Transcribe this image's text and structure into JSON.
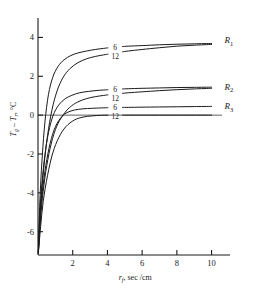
{
  "chart_data": {
    "type": "line",
    "title": "",
    "subtitle": "",
    "xlabel": "r_f , sec/cm",
    "xlabel_parts": {
      "main": "r",
      "sub": "f",
      "rest": ", sec /cm"
    },
    "ylabel": "T_g - T_r , °C",
    "ylabel_parts": {
      "t1": "T",
      "s1": "g",
      "dash": "–",
      "t2": "T",
      "s2": "r",
      "rest": ", °C"
    },
    "xlim": [
      0,
      10.6
    ],
    "ylim": [
      -7.2,
      5.0
    ],
    "xticks": [
      2,
      4,
      6,
      8,
      10
    ],
    "xtick_labels": [
      "2",
      "4",
      "6",
      "8",
      "10"
    ],
    "yticks": [
      4,
      2,
      0,
      -2,
      -4,
      -6
    ],
    "ytick_labels": [
      "4",
      "2",
      "0",
      "-2",
      "-4",
      "-6"
    ],
    "grid": false,
    "legend_position": "inline-curve-labels",
    "zero_line": true,
    "axis_color": "#1a1a1a",
    "curve_color": "#1a1a1a",
    "groups": [
      {
        "name": "R1",
        "label": "R",
        "label_sub": "1",
        "label_x": 10.75,
        "label_y": 3.85,
        "series": [
          {
            "name": "6",
            "inline_label": "6",
            "inline_label_x": 4.45,
            "inline_label_y": 3.52,
            "x": [
              0.02,
              0.08,
              0.15,
              0.25,
              0.4,
              0.6,
              0.85,
              1.15,
              1.5,
              1.9,
              2.3,
              2.8,
              3.3,
              3.9,
              4.4,
              5.2,
              6.0,
              7.0,
              8.0,
              9.0,
              10.0
            ],
            "y": [
              -7.05,
              -5.1,
              -3.6,
              -2.05,
              -0.35,
              1.05,
              1.95,
              2.5,
              2.85,
              3.07,
              3.2,
              3.3,
              3.38,
              3.45,
              3.5,
              3.55,
              3.58,
              3.62,
              3.65,
              3.67,
              3.69
            ]
          },
          {
            "name": "12",
            "inline_label": "12",
            "inline_label_x": 4.45,
            "inline_label_y": 3.02,
            "x": [
              0.02,
              0.1,
              0.2,
              0.35,
              0.55,
              0.8,
              1.1,
              1.45,
              1.85,
              2.3,
              2.8,
              3.3,
              3.9,
              4.4,
              5.2,
              6.0,
              7.0,
              8.0,
              9.0,
              10.0
            ],
            "y": [
              -7.1,
              -5.6,
              -4.15,
              -2.55,
              -1.05,
              0.25,
              1.25,
              1.95,
              2.4,
              2.7,
              2.9,
              3.02,
              3.12,
              3.2,
              3.3,
              3.38,
              3.47,
              3.55,
              3.6,
              3.64
            ]
          }
        ]
      },
      {
        "name": "R2",
        "label": "R",
        "label_sub": "2",
        "label_x": 10.75,
        "label_y": 1.45,
        "series": [
          {
            "name": "6",
            "inline_label": "6",
            "inline_label_x": 4.45,
            "inline_label_y": 1.32,
            "x": [
              0.02,
              0.1,
              0.2,
              0.35,
              0.55,
              0.8,
              1.1,
              1.5,
              1.95,
              2.4,
              2.9,
              3.4,
              3.9,
              4.4,
              5.2,
              6.0,
              7.0,
              8.0,
              9.0,
              10.0
            ],
            "y": [
              -7.05,
              -5.2,
              -3.8,
              -2.4,
              -1.15,
              -0.2,
              0.4,
              0.8,
              1.02,
              1.15,
              1.22,
              1.27,
              1.3,
              1.33,
              1.36,
              1.38,
              1.4,
              1.42,
              1.43,
              1.44
            ]
          },
          {
            "name": "12",
            "inline_label": "12",
            "inline_label_x": 4.45,
            "inline_label_y": 0.88,
            "x": [
              0.02,
              0.12,
              0.25,
              0.45,
              0.7,
              1.0,
              1.35,
              1.8,
              2.3,
              2.8,
              3.3,
              3.9,
              4.4,
              5.2,
              6.0,
              7.0,
              8.0,
              9.0,
              10.0
            ],
            "y": [
              -7.1,
              -5.65,
              -4.3,
              -2.9,
              -1.7,
              -0.75,
              -0.12,
              0.38,
              0.68,
              0.85,
              0.95,
              1.03,
              1.08,
              1.15,
              1.2,
              1.26,
              1.31,
              1.35,
              1.38
            ]
          }
        ]
      },
      {
        "name": "R3",
        "label": "R",
        "label_sub": "3",
        "label_x": 10.75,
        "label_y": 0.45,
        "series": [
          {
            "name": "6",
            "inline_label": "6",
            "inline_label_x": 4.45,
            "inline_label_y": 0.42,
            "x": [
              0.02,
              0.12,
              0.25,
              0.45,
              0.7,
              1.0,
              1.4,
              1.85,
              2.35,
              2.85,
              3.35,
              3.9,
              4.4,
              5.2,
              6.0,
              7.0,
              8.0,
              9.0,
              10.0
            ],
            "y": [
              -7.05,
              -5.3,
              -3.95,
              -2.6,
              -1.45,
              -0.6,
              -0.05,
              0.2,
              0.3,
              0.34,
              0.36,
              0.38,
              0.39,
              0.4,
              0.41,
              0.42,
              0.43,
              0.44,
              0.45
            ]
          },
          {
            "name": "12",
            "inline_label": "12",
            "inline_label_x": 4.45,
            "inline_label_y": -0.06,
            "x": [
              0.02,
              0.15,
              0.3,
              0.55,
              0.85,
              1.2,
              1.6,
              2.1,
              2.6,
              3.1,
              3.6,
              4.1,
              4.4,
              5.2,
              6.0,
              7.0,
              8.0,
              9.0,
              10.0
            ],
            "y": [
              -7.1,
              -5.75,
              -4.45,
              -3.1,
              -1.95,
              -1.15,
              -0.6,
              -0.25,
              -0.1,
              -0.04,
              -0.01,
              0.0,
              0.0,
              0.0,
              0.0,
              0.0,
              0.0,
              0.0,
              0.0
            ]
          }
        ]
      }
    ]
  }
}
